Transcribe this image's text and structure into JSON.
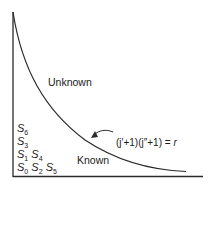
{
  "diagram": {
    "regions": {
      "unknown": "Unknown",
      "known": "Known"
    },
    "equation": {
      "lhs": "(j′+1)(j″+1)",
      "eq": "=",
      "rhs": "r"
    },
    "states": [
      {
        "row": 1,
        "items": [
          {
            "base": "S",
            "sub": "6"
          }
        ]
      },
      {
        "row": 2,
        "items": [
          {
            "base": "S",
            "sub": "3"
          }
        ]
      },
      {
        "row": 3,
        "items": [
          {
            "base": "S",
            "sub": "1"
          },
          {
            "base": "S",
            "sub": "4"
          }
        ]
      },
      {
        "row": 4,
        "items": [
          {
            "base": "S",
            "sub": "0"
          },
          {
            "base": "S",
            "sub": "2"
          },
          {
            "base": "S",
            "sub": "5"
          }
        ]
      }
    ],
    "colors": {
      "line": "#2a2a2a",
      "text": "#1a1a1a",
      "background": "#ffffff"
    }
  }
}
